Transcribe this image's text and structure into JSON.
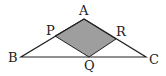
{
  "diagram": {
    "type": "geometry-triangle",
    "fill_color": "#9e9e9e",
    "stroke_color": "#222222",
    "background": "#ffffff",
    "points": {
      "A": [
        84,
        19
      ],
      "B": [
        21,
        57
      ],
      "C": [
        146,
        57
      ],
      "P": [
        55,
        36
      ],
      "Q": [
        89,
        57
      ],
      "R": [
        116,
        39
      ]
    },
    "labels": {
      "A": "A",
      "B": "B",
      "C": "C",
      "P": "P",
      "Q": "Q",
      "R": "R"
    },
    "shaded_region": "APQR"
  }
}
